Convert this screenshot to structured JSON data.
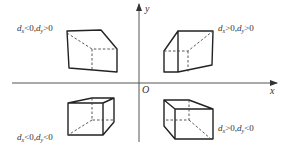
{
  "diagram": {
    "axes": {
      "x_label": "x",
      "y_label": "y",
      "origin_label": "O"
    },
    "quadrants": [
      {
        "id": "top-left",
        "label_d": "d",
        "label_x_sub": "x",
        "label_x_cond": "<0,",
        "label_y_sub": "y",
        "label_y_cond": ">0"
      },
      {
        "id": "top-right",
        "label_d": "d",
        "label_x_sub": "x",
        "label_x_cond": ">0,",
        "label_y_sub": "y",
        "label_y_cond": ">0"
      },
      {
        "id": "bottom-left",
        "label_d": "d",
        "label_x_sub": "x",
        "label_x_cond": "<0,",
        "label_y_sub": "y",
        "label_y_cond": "<0"
      },
      {
        "id": "bottom-right",
        "label_d": "d",
        "label_x_sub": "x",
        "label_x_cond": ">0,",
        "label_y_sub": "y",
        "label_y_cond": "<0"
      }
    ]
  }
}
